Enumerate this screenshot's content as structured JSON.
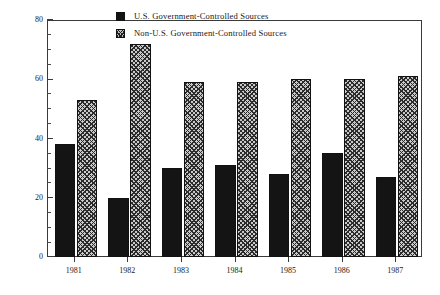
{
  "chart_data": {
    "type": "bar",
    "title": "",
    "subtitle": "",
    "xlabel": "",
    "ylabel": "Percent of Network Stories",
    "categories": [
      "1981",
      "1982",
      "1983",
      "1984",
      "1985",
      "1986",
      "1987"
    ],
    "series": [
      {
        "name": "U.S. Government-Controlled Sources",
        "fill": "solid-black",
        "values": [
          38,
          20,
          30,
          31,
          28,
          35,
          27
        ]
      },
      {
        "name": "Non-U.S. Government-Controlled Sources",
        "fill": "crosshatch-gray",
        "values": [
          53,
          72,
          59,
          59,
          60,
          60,
          61
        ]
      }
    ],
    "ylim": [
      0,
      80
    ],
    "y_major_ticks": [
      0,
      20,
      40,
      60,
      80
    ],
    "y_tick_labels": [
      "0",
      "20",
      "40",
      "60",
      "80"
    ],
    "y_minor_tick_interval": 5,
    "grid": false,
    "legend_position": "top-center-inside",
    "frame": "full-box",
    "colors": {
      "series_1": "#141414",
      "series_2": "#c9c9c9",
      "axis": "#3a3a3a",
      "text": "#1a1a1a",
      "background": "#ffffff"
    }
  },
  "legend": {
    "items": [
      {
        "label": "U.S. Government-Controlled Sources",
        "swatch": "solid"
      },
      {
        "label": "Non-U.S. Government-Controlled Sources",
        "swatch": "hatch"
      }
    ]
  }
}
